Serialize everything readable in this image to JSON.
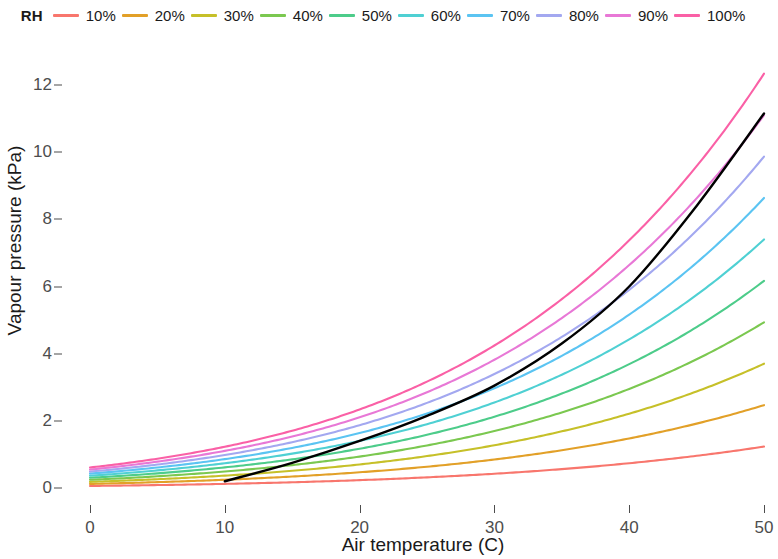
{
  "legend": {
    "title": "RH",
    "items": [
      {
        "label": "10%",
        "color": "#F8766D"
      },
      {
        "label": "20%",
        "color": "#E2A028"
      },
      {
        "label": "30%",
        "color": "#C6C029"
      },
      {
        "label": "40%",
        "color": "#7BC850"
      },
      {
        "label": "50%",
        "color": "#4DCC8A"
      },
      {
        "label": "60%",
        "color": "#4FD0D3"
      },
      {
        "label": "70%",
        "color": "#5BC4F2"
      },
      {
        "label": "80%",
        "color": "#A3A8F0"
      },
      {
        "label": "90%",
        "color": "#E878D6"
      },
      {
        "label": "100%",
        "color": "#FA60A6"
      }
    ]
  },
  "axes": {
    "x_title": "Air temperature (C)",
    "y_title": "Vapour pressure (kPa)",
    "x_ticks": [
      "0",
      "10",
      "20",
      "30",
      "40",
      "50"
    ],
    "y_ticks": [
      "0",
      "2",
      "4",
      "6",
      "8",
      "10",
      "12"
    ]
  },
  "chart_data": {
    "type": "line",
    "title": "",
    "xlabel": "Air temperature (C)",
    "ylabel": "Vapour pressure (kPa)",
    "xlim": [
      0,
      50
    ],
    "ylim": [
      0,
      12.6
    ],
    "grid": false,
    "legend_position": "top",
    "legend_title": "RH",
    "x": [
      0,
      5,
      10,
      15,
      20,
      25,
      30,
      35,
      40,
      45,
      50
    ],
    "series": [
      {
        "name": "10%",
        "color": "#F8766D",
        "values": [
          0.061,
          0.087,
          0.123,
          0.17,
          0.234,
          0.317,
          0.424,
          0.562,
          0.738,
          0.959,
          1.234
        ]
      },
      {
        "name": "20%",
        "color": "#E2A028",
        "values": [
          0.122,
          0.175,
          0.245,
          0.341,
          0.467,
          0.634,
          0.849,
          1.125,
          1.475,
          1.917,
          2.468
        ]
      },
      {
        "name": "30%",
        "color": "#C6C029",
        "values": [
          0.183,
          0.262,
          0.368,
          0.511,
          0.701,
          0.951,
          1.273,
          1.687,
          2.213,
          2.876,
          3.703
        ]
      },
      {
        "name": "40%",
        "color": "#7BC850",
        "values": [
          0.244,
          0.349,
          0.491,
          0.682,
          0.935,
          1.268,
          1.698,
          2.249,
          2.951,
          3.835,
          4.937
        ]
      },
      {
        "name": "50%",
        "color": "#4DCC8A",
        "values": [
          0.305,
          0.437,
          0.614,
          0.852,
          1.169,
          1.584,
          2.122,
          2.811,
          3.688,
          4.794,
          6.171
        ]
      },
      {
        "name": "60%",
        "color": "#4FD0D3",
        "values": [
          0.366,
          0.524,
          0.737,
          1.023,
          1.402,
          1.901,
          2.547,
          3.374,
          4.426,
          5.752,
          7.405
        ]
      },
      {
        "name": "70%",
        "color": "#5BC4F2",
        "values": [
          0.427,
          0.611,
          0.859,
          1.193,
          1.636,
          2.218,
          2.971,
          3.936,
          5.164,
          6.711,
          8.639
        ]
      },
      {
        "name": "80%",
        "color": "#A3A8F0",
        "values": [
          0.488,
          0.699,
          0.982,
          1.364,
          1.87,
          2.535,
          3.396,
          4.498,
          5.902,
          7.67,
          9.873
        ]
      },
      {
        "name": "90%",
        "color": "#E878D6",
        "values": [
          0.549,
          0.786,
          1.105,
          1.534,
          2.104,
          2.852,
          3.82,
          5.061,
          6.639,
          8.628,
          11.107
        ]
      },
      {
        "name": "100%",
        "color": "#FA60A6",
        "values": [
          0.611,
          0.873,
          1.228,
          1.705,
          2.338,
          3.169,
          4.245,
          5.623,
          7.377,
          9.586,
          12.341
        ]
      }
    ],
    "overlay_series": {
      "name": "saturation-reference",
      "color": "#000000",
      "x": [
        10,
        15,
        20,
        25,
        30,
        35,
        40,
        45,
        50
      ],
      "values": [
        0.2,
        0.75,
        1.4,
        2.15,
        3.05,
        4.3,
        6.0,
        8.4,
        11.15
      ]
    }
  }
}
